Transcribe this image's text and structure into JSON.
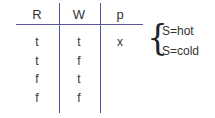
{
  "table": {
    "headers": [
      "R",
      "W",
      "p"
    ],
    "rows": [
      [
        "t",
        "t",
        "x"
      ],
      [
        "t",
        "f",
        ""
      ],
      [
        "f",
        "t",
        ""
      ],
      [
        "f",
        "f",
        ""
      ]
    ]
  },
  "annotation": {
    "brace": "{",
    "options": [
      "S=hot",
      "S=cold"
    ]
  },
  "colors": {
    "rule": "#5a5a9e",
    "text": "#333333"
  }
}
